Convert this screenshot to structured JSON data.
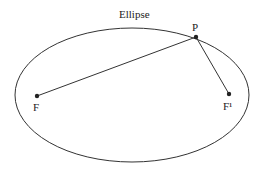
{
  "diagram": {
    "title": "Ellipse",
    "colors": {
      "stroke": "#333333",
      "text": "#222222",
      "background": "#ffffff"
    },
    "ellipse": {
      "cx": 132,
      "cy": 95,
      "rx": 117,
      "ry": 67
    },
    "points": [
      {
        "id": "P",
        "label": "P",
        "x": 196,
        "y": 37
      },
      {
        "id": "F",
        "label": "F",
        "x": 37,
        "y": 96
      },
      {
        "id": "F1",
        "label": "F¹",
        "x": 229,
        "y": 94
      }
    ],
    "segments": [
      {
        "from": "F",
        "to": "P"
      },
      {
        "from": "P",
        "to": "F1"
      }
    ]
  }
}
